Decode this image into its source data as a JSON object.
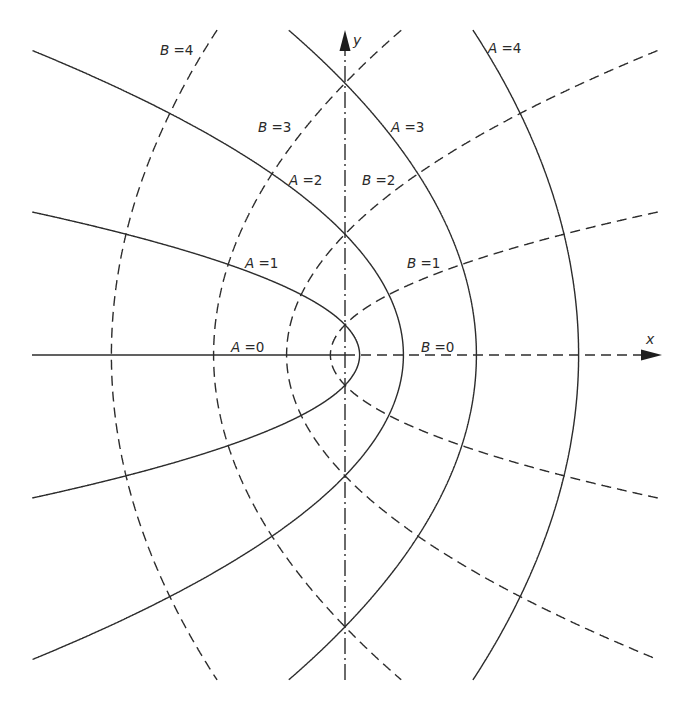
{
  "diagram": {
    "type": "parabolic-coordinate-grid",
    "origin_px": [
      345,
      355
    ],
    "scale_px": {
      "x": 14.6,
      "y": 15.1
    },
    "relation": {
      "x": "A^2 - B^2",
      "y": "2AB"
    },
    "clip_px": {
      "x_min": 32,
      "x_max": 658,
      "y_min": 30,
      "y_max": 680
    },
    "colors": {
      "line": "#2c2c2c",
      "background": "#ffffff"
    },
    "axes": {
      "x_label": "x",
      "y_label": "y",
      "x_style": "dashed (positive side, B = 0) / solid (negative side, A = 0)",
      "y_style": "dash-dot"
    },
    "solid_family": {
      "symbol": "A",
      "style": "solid",
      "values": [
        0,
        1,
        2,
        3,
        4
      ]
    },
    "dashed_family": {
      "symbol": "B",
      "style": "dashed",
      "values": [
        0,
        1,
        2,
        3,
        4
      ]
    },
    "labels": [
      {
        "symbol": "B",
        "rest": " =4"
      },
      {
        "symbol": "A",
        "rest": " =4"
      },
      {
        "symbol": "B",
        "rest": " =3"
      },
      {
        "symbol": "A",
        "rest": " =3"
      },
      {
        "symbol": "A",
        "rest": " =2"
      },
      {
        "symbol": "B",
        "rest": " =2"
      },
      {
        "symbol": "A",
        "rest": " =1"
      },
      {
        "symbol": "B",
        "rest": " =1"
      },
      {
        "symbol": "A",
        "rest": " =0"
      },
      {
        "symbol": "B",
        "rest": " =0"
      }
    ]
  }
}
